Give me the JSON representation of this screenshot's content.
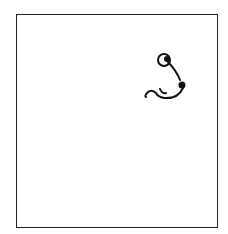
{
  "canvas": {
    "background": "#ffffff",
    "border_color": "#222222",
    "stroke_color": "#111111"
  },
  "drawing": {
    "description": "hand-drawn sketch: small circle with dot, curved line to a filled dot, ending in a squiggle"
  }
}
